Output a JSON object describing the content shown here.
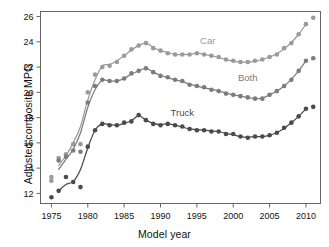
{
  "figure": {
    "top_cropped_text": "",
    "background_color": "#ffffff"
  },
  "axes": {
    "x_title": "Model year",
    "y_title": "Adjusted composite MPG",
    "x_ticks": [
      "1975",
      "1980",
      "1985",
      "1990",
      "1995",
      "2000",
      "2005",
      "2010"
    ],
    "y_ticks": [
      "12",
      "14",
      "16",
      "18",
      "20",
      "22",
      "24",
      "26"
    ]
  },
  "labels": {
    "car": "Car",
    "both": "Both",
    "truck": "Truck"
  },
  "chart_data": {
    "type": "scatter",
    "title": "",
    "subtitle": "",
    "xlabel": "Model year",
    "ylabel": "Adjusted composite MPG",
    "xlim": [
      1973.5,
      2012.0
    ],
    "ylim": [
      11.2,
      26.4
    ],
    "xticks": [
      1975,
      1980,
      1985,
      1990,
      1995,
      2000,
      2005,
      2010
    ],
    "yticks": [
      12,
      14,
      16,
      18,
      20,
      22,
      24,
      26
    ],
    "grid": false,
    "legend": "inline-annotations",
    "legend_position": "right-of-curves",
    "colors": {
      "car": "#9a9a9a",
      "both": "#7c7c7c",
      "truck": "#4a4a4a",
      "axis": "#555555",
      "text": "#111111"
    },
    "marker": "filled-circle",
    "marker_size_px": 2.3,
    "series": [
      {
        "name": "Car",
        "color": "#9a9a9a",
        "label_x": 1996.5,
        "label_y": 23.85,
        "points": [
          {
            "x": 1975,
            "y": 13.3
          },
          {
            "x": 1975,
            "y": 13.0
          },
          {
            "x": 1976,
            "y": 14.8
          },
          {
            "x": 1977,
            "y": 15.1
          },
          {
            "x": 1978,
            "y": 15.9
          },
          {
            "x": 1979,
            "y": 15.9
          },
          {
            "x": 1980,
            "y": 20.0
          },
          {
            "x": 1981,
            "y": 21.4
          },
          {
            "x": 1982,
            "y": 22.0
          },
          {
            "x": 1983,
            "y": 22.1
          },
          {
            "x": 1984,
            "y": 22.4
          },
          {
            "x": 1985,
            "y": 22.9
          },
          {
            "x": 1986,
            "y": 23.4
          },
          {
            "x": 1987,
            "y": 23.7
          },
          {
            "x": 1988,
            "y": 23.9
          },
          {
            "x": 1989,
            "y": 23.5
          },
          {
            "x": 1990,
            "y": 23.3
          },
          {
            "x": 1991,
            "y": 23.1
          },
          {
            "x": 1992,
            "y": 23.0
          },
          {
            "x": 1993,
            "y": 23.0
          },
          {
            "x": 1994,
            "y": 23.0
          },
          {
            "x": 1995,
            "y": 23.1
          },
          {
            "x": 1996,
            "y": 23.0
          },
          {
            "x": 1997,
            "y": 22.9
          },
          {
            "x": 1998,
            "y": 22.8
          },
          {
            "x": 1999,
            "y": 22.6
          },
          {
            "x": 2000,
            "y": 22.5
          },
          {
            "x": 2001,
            "y": 22.4
          },
          {
            "x": 2002,
            "y": 22.4
          },
          {
            "x": 2003,
            "y": 22.5
          },
          {
            "x": 2004,
            "y": 22.6
          },
          {
            "x": 2005,
            "y": 22.8
          },
          {
            "x": 2006,
            "y": 23.0
          },
          {
            "x": 2007,
            "y": 23.5
          },
          {
            "x": 2008,
            "y": 23.9
          },
          {
            "x": 2009,
            "y": 24.6
          },
          {
            "x": 2010,
            "y": 25.4
          },
          {
            "x": 2011,
            "y": 25.9
          }
        ],
        "smoothed_line": [
          {
            "x": 1976,
            "y": 14.2
          },
          {
            "x": 1977,
            "y": 15.0
          },
          {
            "x": 1978,
            "y": 16.0
          },
          {
            "x": 1979,
            "y": 17.3
          },
          {
            "x": 1980,
            "y": 19.4
          },
          {
            "x": 1981,
            "y": 21.0
          },
          {
            "x": 1982,
            "y": 22.1
          },
          {
            "x": 1983,
            "y": 22.2
          },
          {
            "x": 1984,
            "y": 22.5
          },
          {
            "x": 1985,
            "y": 22.9
          },
          {
            "x": 1986,
            "y": 23.35
          },
          {
            "x": 1987,
            "y": 23.7
          },
          {
            "x": 1988,
            "y": 23.9
          },
          {
            "x": 1989,
            "y": 23.55
          },
          {
            "x": 1990,
            "y": 23.3
          },
          {
            "x": 1991,
            "y": 23.15
          },
          {
            "x": 1992,
            "y": 23.0
          },
          {
            "x": 1993,
            "y": 23.0
          },
          {
            "x": 1994,
            "y": 23.0
          },
          {
            "x": 1995,
            "y": 23.1
          },
          {
            "x": 1996,
            "y": 23.0
          },
          {
            "x": 1997,
            "y": 22.9
          },
          {
            "x": 1998,
            "y": 22.75
          },
          {
            "x": 1999,
            "y": 22.6
          },
          {
            "x": 2000,
            "y": 22.45
          },
          {
            "x": 2001,
            "y": 22.4
          },
          {
            "x": 2002,
            "y": 22.4
          },
          {
            "x": 2003,
            "y": 22.45
          },
          {
            "x": 2004,
            "y": 22.6
          },
          {
            "x": 2005,
            "y": 22.8
          },
          {
            "x": 2006,
            "y": 23.05
          },
          {
            "x": 2007,
            "y": 23.45
          },
          {
            "x": 2008,
            "y": 23.95
          },
          {
            "x": 2009,
            "y": 24.6
          },
          {
            "x": 2010,
            "y": 25.4
          }
        ]
      },
      {
        "name": "Both",
        "color": "#7c7c7c",
        "label_x": 2002.0,
        "label_y": 20.9,
        "points": [
          {
            "x": 1976,
            "y": 14.6
          },
          {
            "x": 1977,
            "y": 14.9
          },
          {
            "x": 1978,
            "y": 15.4
          },
          {
            "x": 1979,
            "y": 15.3
          },
          {
            "x": 1980,
            "y": 19.2
          },
          {
            "x": 1981,
            "y": 20.5
          },
          {
            "x": 1982,
            "y": 21.0
          },
          {
            "x": 1983,
            "y": 20.9
          },
          {
            "x": 1984,
            "y": 20.9
          },
          {
            "x": 1985,
            "y": 21.1
          },
          {
            "x": 1986,
            "y": 21.5
          },
          {
            "x": 1987,
            "y": 21.7
          },
          {
            "x": 1988,
            "y": 21.9
          },
          {
            "x": 1989,
            "y": 21.6
          },
          {
            "x": 1990,
            "y": 21.3
          },
          {
            "x": 1991,
            "y": 21.2
          },
          {
            "x": 1992,
            "y": 21.0
          },
          {
            "x": 1993,
            "y": 20.9
          },
          {
            "x": 1994,
            "y": 20.6
          },
          {
            "x": 1995,
            "y": 20.5
          },
          {
            "x": 1996,
            "y": 20.4
          },
          {
            "x": 1997,
            "y": 20.2
          },
          {
            "x": 1998,
            "y": 20.1
          },
          {
            "x": 1999,
            "y": 19.9
          },
          {
            "x": 2000,
            "y": 19.8
          },
          {
            "x": 2001,
            "y": 19.7
          },
          {
            "x": 2002,
            "y": 19.6
          },
          {
            "x": 2003,
            "y": 19.5
          },
          {
            "x": 2004,
            "y": 19.5
          },
          {
            "x": 2005,
            "y": 19.8
          },
          {
            "x": 2006,
            "y": 20.1
          },
          {
            "x": 2007,
            "y": 20.5
          },
          {
            "x": 2008,
            "y": 21.0
          },
          {
            "x": 2009,
            "y": 21.7
          },
          {
            "x": 2010,
            "y": 22.5
          },
          {
            "x": 2011,
            "y": 22.7
          }
        ],
        "smoothed_line": [
          {
            "x": 1976,
            "y": 13.9
          },
          {
            "x": 1977,
            "y": 14.7
          },
          {
            "x": 1978,
            "y": 15.5
          },
          {
            "x": 1979,
            "y": 16.8
          },
          {
            "x": 1980,
            "y": 18.8
          },
          {
            "x": 1981,
            "y": 20.2
          },
          {
            "x": 1982,
            "y": 20.95
          },
          {
            "x": 1983,
            "y": 20.9
          },
          {
            "x": 1984,
            "y": 20.9
          },
          {
            "x": 1985,
            "y": 21.1
          },
          {
            "x": 1986,
            "y": 21.45
          },
          {
            "x": 1987,
            "y": 21.7
          },
          {
            "x": 1988,
            "y": 21.9
          },
          {
            "x": 1989,
            "y": 21.6
          },
          {
            "x": 1990,
            "y": 21.35
          },
          {
            "x": 1991,
            "y": 21.15
          },
          {
            "x": 1992,
            "y": 21.0
          },
          {
            "x": 1993,
            "y": 20.85
          },
          {
            "x": 1994,
            "y": 20.65
          },
          {
            "x": 1995,
            "y": 20.5
          },
          {
            "x": 1996,
            "y": 20.35
          },
          {
            "x": 1997,
            "y": 20.25
          },
          {
            "x": 1998,
            "y": 20.1
          },
          {
            "x": 1999,
            "y": 19.95
          },
          {
            "x": 2000,
            "y": 19.8
          },
          {
            "x": 2001,
            "y": 19.7
          },
          {
            "x": 2002,
            "y": 19.6
          },
          {
            "x": 2003,
            "y": 19.5
          },
          {
            "x": 2004,
            "y": 19.55
          },
          {
            "x": 2005,
            "y": 19.8
          },
          {
            "x": 2006,
            "y": 20.1
          },
          {
            "x": 2007,
            "y": 20.5
          },
          {
            "x": 2008,
            "y": 21.05
          },
          {
            "x": 2009,
            "y": 21.7
          },
          {
            "x": 2010,
            "y": 22.5
          }
        ]
      },
      {
        "name": "Truck",
        "color": "#4a4a4a",
        "label_x": 1993.0,
        "label_y": 18.1,
        "points": [
          {
            "x": 1975,
            "y": 11.7
          },
          {
            "x": 1976,
            "y": 12.2
          },
          {
            "x": 1977,
            "y": 13.3
          },
          {
            "x": 1978,
            "y": 12.9
          },
          {
            "x": 1979,
            "y": 12.5
          },
          {
            "x": 1980,
            "y": 15.7
          },
          {
            "x": 1981,
            "y": 17.0
          },
          {
            "x": 1982,
            "y": 17.5
          },
          {
            "x": 1983,
            "y": 17.4
          },
          {
            "x": 1984,
            "y": 17.4
          },
          {
            "x": 1985,
            "y": 17.6
          },
          {
            "x": 1986,
            "y": 17.7
          },
          {
            "x": 1987,
            "y": 18.2
          },
          {
            "x": 1988,
            "y": 17.8
          },
          {
            "x": 1989,
            "y": 17.5
          },
          {
            "x": 1990,
            "y": 17.4
          },
          {
            "x": 1991,
            "y": 17.5
          },
          {
            "x": 1992,
            "y": 17.4
          },
          {
            "x": 1993,
            "y": 17.3
          },
          {
            "x": 1994,
            "y": 17.1
          },
          {
            "x": 1995,
            "y": 17.0
          },
          {
            "x": 1996,
            "y": 17.0
          },
          {
            "x": 1997,
            "y": 16.9
          },
          {
            "x": 1998,
            "y": 16.9
          },
          {
            "x": 1999,
            "y": 16.7
          },
          {
            "x": 2000,
            "y": 16.7
          },
          {
            "x": 2001,
            "y": 16.5
          },
          {
            "x": 2002,
            "y": 16.4
          },
          {
            "x": 2003,
            "y": 16.5
          },
          {
            "x": 2004,
            "y": 16.5
          },
          {
            "x": 2005,
            "y": 16.6
          },
          {
            "x": 2006,
            "y": 16.8
          },
          {
            "x": 2007,
            "y": 17.2
          },
          {
            "x": 2008,
            "y": 17.6
          },
          {
            "x": 2009,
            "y": 18.1
          },
          {
            "x": 2010,
            "y": 18.7
          },
          {
            "x": 2011,
            "y": 18.85
          }
        ],
        "smoothed_line": [
          {
            "x": 1976,
            "y": 12.2
          },
          {
            "x": 1977,
            "y": 12.7
          },
          {
            "x": 1978,
            "y": 12.95
          },
          {
            "x": 1979,
            "y": 13.9
          },
          {
            "x": 1980,
            "y": 15.6
          },
          {
            "x": 1981,
            "y": 17.0
          },
          {
            "x": 1982,
            "y": 17.5
          },
          {
            "x": 1983,
            "y": 17.45
          },
          {
            "x": 1984,
            "y": 17.4
          },
          {
            "x": 1985,
            "y": 17.55
          },
          {
            "x": 1986,
            "y": 17.75
          },
          {
            "x": 1987,
            "y": 18.15
          },
          {
            "x": 1988,
            "y": 17.8
          },
          {
            "x": 1989,
            "y": 17.55
          },
          {
            "x": 1990,
            "y": 17.45
          },
          {
            "x": 1991,
            "y": 17.5
          },
          {
            "x": 1992,
            "y": 17.4
          },
          {
            "x": 1993,
            "y": 17.25
          },
          {
            "x": 1994,
            "y": 17.1
          },
          {
            "x": 1995,
            "y": 17.05
          },
          {
            "x": 1996,
            "y": 17.0
          },
          {
            "x": 1997,
            "y": 16.95
          },
          {
            "x": 1998,
            "y": 16.9
          },
          {
            "x": 1999,
            "y": 16.75
          },
          {
            "x": 2000,
            "y": 16.65
          },
          {
            "x": 2001,
            "y": 16.5
          },
          {
            "x": 2002,
            "y": 16.45
          },
          {
            "x": 2003,
            "y": 16.5
          },
          {
            "x": 2004,
            "y": 16.5
          },
          {
            "x": 2005,
            "y": 16.6
          },
          {
            "x": 2006,
            "y": 16.8
          },
          {
            "x": 2007,
            "y": 17.15
          },
          {
            "x": 2008,
            "y": 17.6
          },
          {
            "x": 2009,
            "y": 18.1
          },
          {
            "x": 2010,
            "y": 18.7
          }
        ]
      }
    ]
  }
}
